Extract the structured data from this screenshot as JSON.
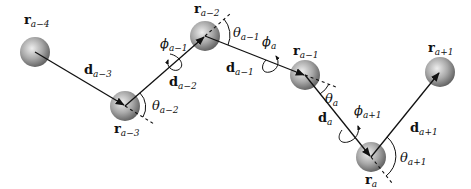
{
  "diagram": {
    "colors": {
      "line": "#111111",
      "bead_light": "#e6e6e6",
      "bead_dark": "#6e6e6e",
      "background": "#ffffff"
    },
    "beads": [
      {
        "id": "r_a-4",
        "base": "r",
        "sub": "a−4",
        "cx": 35,
        "cy": 52,
        "r": 15,
        "label_x": 24,
        "label_y": 24
      },
      {
        "id": "r_a-3",
        "base": "r",
        "sub": "a−3",
        "cx": 125,
        "cy": 106,
        "r": 15,
        "label_x": 114,
        "label_y": 133
      },
      {
        "id": "r_a-2",
        "base": "r",
        "sub": "a−2",
        "cx": 205,
        "cy": 36,
        "r": 15,
        "label_x": 194,
        "label_y": 13
      },
      {
        "id": "r_a-1",
        "base": "r",
        "sub": "a−1",
        "cx": 305,
        "cy": 75,
        "r": 15,
        "label_x": 293,
        "label_y": 55
      },
      {
        "id": "r_a",
        "base": "r",
        "sub": "a",
        "cx": 371,
        "cy": 157,
        "r": 15,
        "label_x": 365,
        "label_y": 184
      },
      {
        "id": "r_a+1",
        "base": "r",
        "sub": "a+1",
        "cx": 440,
        "cy": 72,
        "r": 15,
        "label_x": 428,
        "label_y": 52
      }
    ],
    "bond_vectors": [
      {
        "id": "d_a-3",
        "base": "d",
        "sub": "a−3",
        "label_x": 84,
        "label_y": 74
      },
      {
        "id": "d_a-2",
        "base": "d",
        "sub": "a−2",
        "label_x": 169,
        "label_y": 86
      },
      {
        "id": "d_a-1",
        "base": "d",
        "sub": "a−1",
        "label_x": 226,
        "label_y": 72
      },
      {
        "id": "d_a",
        "base": "d",
        "sub": "a",
        "label_x": 318,
        "label_y": 122
      },
      {
        "id": "d_a+1",
        "base": "d",
        "sub": "a+1",
        "label_x": 410,
        "label_y": 132
      }
    ],
    "bond_angles": [
      {
        "id": "theta_a-2",
        "symbol": "θ",
        "sub": "a−2",
        "label_x": 152,
        "label_y": 110
      },
      {
        "id": "theta_a-1",
        "symbol": "θ",
        "sub": "a−1",
        "label_x": 233,
        "label_y": 37
      },
      {
        "id": "theta_a",
        "symbol": "θ",
        "sub": "a",
        "label_x": 325,
        "label_y": 103
      },
      {
        "id": "theta_a+1",
        "symbol": "θ",
        "sub": "a+1",
        "label_x": 400,
        "label_y": 162
      }
    ],
    "torsion_angles": [
      {
        "id": "phi_a-1",
        "symbol": "ϕ",
        "sub": "a−1",
        "label_x": 160,
        "label_y": 48
      },
      {
        "id": "phi_a",
        "symbol": "ϕ",
        "sub": "a",
        "label_x": 262,
        "label_y": 46
      },
      {
        "id": "phi_a+1",
        "symbol": "ϕ",
        "sub": "a+1",
        "label_x": 354,
        "label_y": 115
      }
    ]
  }
}
